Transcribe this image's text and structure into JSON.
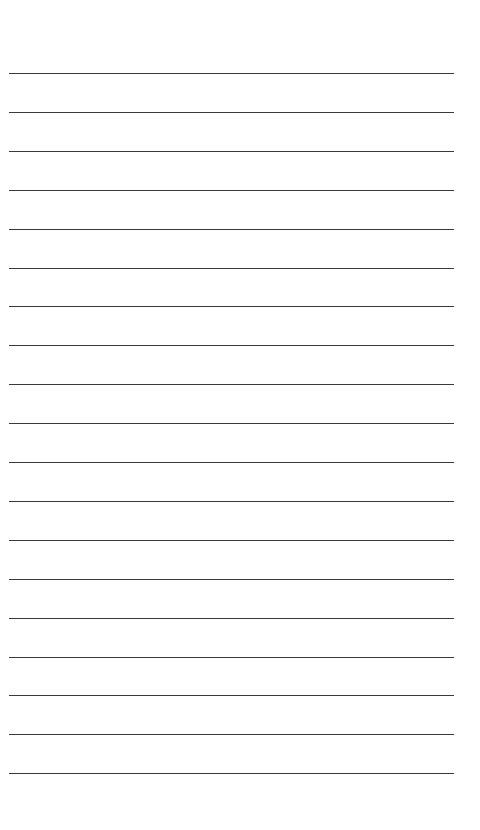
{
  "document": {
    "type": "lined-paper",
    "background_color": "#ffffff",
    "line_color": "#3a3a3a",
    "line_count": 19,
    "line_left": 9,
    "line_right": 454,
    "first_line_y": 73,
    "line_spacing": 38.9
  }
}
